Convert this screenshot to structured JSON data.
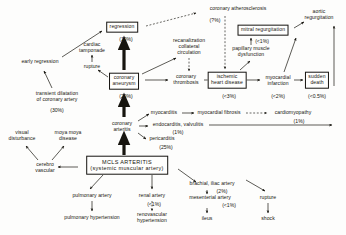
{
  "diagram": {
    "nodes": [
      {
        "id": "regression",
        "label": "regression",
        "pct": "(10%)",
        "boxed": true,
        "x": 122,
        "y": 27
      },
      {
        "id": "coronary-atherosclerosis",
        "label": "coronary atherosclerosis",
        "pct": "(?%)",
        "boxed": false,
        "x": 238,
        "y": 9
      },
      {
        "id": "cardiac-tamponade",
        "label": "cardiac\ntamponade",
        "pct": "",
        "boxed": false,
        "x": 92,
        "y": 48
      },
      {
        "id": "rupture-top",
        "label": "rupture",
        "pct": "",
        "boxed": false,
        "x": 92,
        "y": 67
      },
      {
        "id": "early-regression",
        "label": "early regression",
        "pct": "",
        "boxed": false,
        "x": 40,
        "y": 62
      },
      {
        "id": "transient-dilatation",
        "label": "transient dilatation\nof coronary artery",
        "pct": "(30%)",
        "boxed": false,
        "x": 57,
        "y": 97
      },
      {
        "id": "coronary-aneurysm",
        "label": "coronary\naneurysm",
        "pct": "(20%)",
        "boxed": true,
        "x": 124,
        "y": 81
      },
      {
        "id": "recanalization",
        "label": "recanalization\ncollateral\ncirculation",
        "pct": "",
        "boxed": false,
        "x": 189,
        "y": 47
      },
      {
        "id": "coronary-thrombosis",
        "label": "coronary\nthrombosis",
        "pct": "",
        "boxed": false,
        "x": 186,
        "y": 80
      },
      {
        "id": "mitral-regurgitation",
        "label": "mitral regurgitation",
        "pct": "(<1%)",
        "boxed": true,
        "x": 263,
        "y": 30
      },
      {
        "id": "papillary-muscle",
        "label": "papillary muscle\ndysfunction",
        "pct": "",
        "boxed": false,
        "x": 251,
        "y": 52
      },
      {
        "id": "aortic-regurgitation",
        "label": "aortic\nregurgitation",
        "pct": "",
        "boxed": false,
        "x": 319,
        "y": 15
      },
      {
        "id": "ischemic-heart-disease",
        "label": "ischemic\nheart disease",
        "pct": "(<3%)",
        "boxed": true,
        "x": 227,
        "y": 80
      },
      {
        "id": "myocardial-infarction",
        "label": "myocardial\ninfarction",
        "pct": "(<2%)",
        "boxed": false,
        "x": 278,
        "y": 81
      },
      {
        "id": "sudden-death",
        "label": "sudden\ndeath",
        "pct": "(<0.5%)",
        "boxed": true,
        "x": 317,
        "y": 80
      },
      {
        "id": "myocarditis",
        "label": "myocarditis",
        "pct": "",
        "boxed": false,
        "x": 164,
        "y": 113
      },
      {
        "id": "myocardial-fibrosis",
        "label": "myocardial fibrosis",
        "pct": "",
        "boxed": false,
        "x": 219,
        "y": 113
      },
      {
        "id": "cardiomyopathy",
        "label": "cardiomyopathy",
        "pct": "(1%)",
        "boxed": false,
        "x": 293,
        "y": 113
      },
      {
        "id": "endocarditis",
        "label": "endocarditis, valvulitis",
        "pct": "(1%)",
        "boxed": false,
        "x": 178,
        "y": 125
      },
      {
        "id": "pericarditis",
        "label": "pericarditis",
        "pct": "(25%)",
        "boxed": false,
        "x": 162,
        "y": 139
      },
      {
        "id": "coronary-arteritis",
        "label": "coronary\narteritis",
        "pct": "",
        "boxed": false,
        "x": 122,
        "y": 127
      },
      {
        "id": "visual-disturbance",
        "label": "visual\ndisturbance",
        "pct": "",
        "boxed": false,
        "x": 22,
        "y": 136
      },
      {
        "id": "moya-moya",
        "label": "moya moya\ndisease",
        "pct": "",
        "boxed": false,
        "x": 68,
        "y": 136
      },
      {
        "id": "cerebro-vascular",
        "label": "cerebro\nvascular",
        "pct": "",
        "boxed": false,
        "x": 45,
        "y": 168
      },
      {
        "id": "mcls-arteritis",
        "label": "MCLS ARTERITIS\n(systemic muscular artery)",
        "pct": "",
        "boxed": true,
        "x": 127,
        "y": 165,
        "big": true
      },
      {
        "id": "pulmonary-artery",
        "label": "pulmonary artery",
        "pct": "",
        "boxed": false,
        "x": 92,
        "y": 196
      },
      {
        "id": "pulmonary-hypertension",
        "label": "pulmonary hypertension",
        "pct": "",
        "boxed": false,
        "x": 92,
        "y": 218
      },
      {
        "id": "renal-artery",
        "label": "renal artery",
        "pct": "(<1%)",
        "boxed": false,
        "x": 152,
        "y": 196
      },
      {
        "id": "renovascular-hypertension",
        "label": "renovascular\nhypertension",
        "pct": "",
        "boxed": false,
        "x": 152,
        "y": 218
      },
      {
        "id": "brachial-iliac-artery",
        "label": "brachial, iliac artery",
        "pct": "(2%)",
        "boxed": false,
        "x": 212,
        "y": 184
      },
      {
        "id": "mesenterial-artery",
        "label": "mesenterial artery",
        "pct": "(<1%)",
        "boxed": false,
        "x": 210,
        "y": 198
      },
      {
        "id": "ileus",
        "label": "ileus",
        "pct": "",
        "boxed": false,
        "x": 207,
        "y": 219
      },
      {
        "id": "rupture-bottom",
        "label": "rupture",
        "pct": "",
        "boxed": false,
        "x": 268,
        "y": 198
      },
      {
        "id": "shock",
        "label": "shock",
        "pct": "",
        "boxed": false,
        "x": 268,
        "y": 219
      }
    ],
    "percent_labels": [
      {
        "id": "pct-regression",
        "text": "(10%)",
        "x": 126,
        "y": 39
      },
      {
        "id": "pct-atherosclerosis",
        "text": "(?%)",
        "x": 215,
        "y": 20
      },
      {
        "id": "pct-transient-dilatation",
        "text": "(30%)",
        "x": 57,
        "y": 110
      },
      {
        "id": "pct-coronary-aneurysm",
        "text": "(20%)",
        "x": 126,
        "y": 96
      },
      {
        "id": "pct-mitral-regurgitation",
        "text": "(<1%)",
        "x": 262,
        "y": 41
      },
      {
        "id": "pct-ischemic",
        "text": "(<3%)",
        "x": 229,
        "y": 96
      },
      {
        "id": "pct-myocardial-infarction",
        "text": "(<2%)",
        "x": 278,
        "y": 96
      },
      {
        "id": "pct-sudden-death",
        "text": "(<0.5%)",
        "x": 317,
        "y": 96
      },
      {
        "id": "pct-cardiomyopathy",
        "text": "(1%)",
        "x": 299,
        "y": 121
      },
      {
        "id": "pct-endocarditis",
        "text": "(1%)",
        "x": 178,
        "y": 132
      },
      {
        "id": "pct-pericarditis",
        "text": "(25%)",
        "x": 166,
        "y": 147
      },
      {
        "id": "pct-renal-artery",
        "text": "(<1%)",
        "x": 154,
        "y": 204
      },
      {
        "id": "pct-brachial",
        "text": "(2%)",
        "x": 222,
        "y": 191
      },
      {
        "id": "pct-mesenterial",
        "text": "(<1%)",
        "x": 229,
        "y": 205
      }
    ],
    "edges": [
      {
        "id": "mcls-to-coronary-arteritis",
        "style": "thick",
        "d": "M 124 155 L 124 137"
      },
      {
        "id": "coronary-arteritis-to-aneurysm",
        "style": "thick",
        "d": "M 124 117 L 124 99"
      },
      {
        "id": "aneurysm-to-regression",
        "style": "thick",
        "d": "M 124 70 L 124 42"
      },
      {
        "id": "early-regression-to-regression",
        "style": "thin",
        "d": "M 62 57 L 102 31"
      },
      {
        "id": "transient-to-early-regression",
        "style": "thin",
        "d": "M 52 88 L 44 71"
      },
      {
        "id": "aneurysm-to-rupture",
        "style": "thin",
        "d": "M 108 77 L 98 70"
      },
      {
        "id": "rupture-to-tamponade",
        "style": "thin",
        "d": "M 92 62 L 92 55"
      },
      {
        "id": "regression-to-atherosclerosis",
        "style": "dashed",
        "d": "M 146 26 L 196 13"
      },
      {
        "id": "aneurysm-to-recanalization",
        "style": "thin",
        "d": "M 142 74 L 176 58"
      },
      {
        "id": "recanalization-to-thrombosis",
        "style": "dashed",
        "d": "M 189 58 L 189 71"
      },
      {
        "id": "aneurysm-to-thrombosis",
        "style": "thin",
        "d": "M 145 80 L 168 80"
      },
      {
        "id": "thrombosis-to-ischemic",
        "style": "thin",
        "d": "M 204 80 L 211 80"
      },
      {
        "id": "atherosclerosis-to-ischemic",
        "style": "dashed",
        "d": "M 225 16 L 225 69"
      },
      {
        "id": "ischemic-to-papillary",
        "style": "thin",
        "d": "M 240 70 L 250 61"
      },
      {
        "id": "papillary-to-mitral",
        "style": "thin",
        "d": "M 251 45 L 251 38"
      },
      {
        "id": "mitral-to-aortic",
        "style": "thin",
        "d": "M 294 28 L 304 22"
      },
      {
        "id": "infarction-to-mitral",
        "style": "thin",
        "d": "M 284 72 L 296 38"
      },
      {
        "id": "ischemic-to-infarction",
        "style": "thin",
        "d": "M 244 80 L 260 80"
      },
      {
        "id": "infarction-to-sudden-death",
        "style": "thin",
        "d": "M 294 80 L 303 80"
      },
      {
        "id": "sudden-death-up-aortic",
        "style": "thin",
        "d": "M 334 86 L 334 26"
      },
      {
        "id": "arteritis-to-myocarditis",
        "style": "thin",
        "d": "M 138 121 L 149 114"
      },
      {
        "id": "arteritis-to-endocarditis",
        "style": "thin",
        "d": "M 139 126 L 148 126"
      },
      {
        "id": "arteritis-to-pericarditis",
        "style": "thin",
        "d": "M 138 133 L 146 139"
      },
      {
        "id": "myocarditis-to-fibrosis",
        "style": "thin",
        "d": "M 182 113 L 194 113"
      },
      {
        "id": "fibrosis-to-cardiomyopathy",
        "style": "dashed",
        "d": "M 246 113 L 267 113"
      },
      {
        "id": "endocarditis-to-aortic-line",
        "style": "thin",
        "d": "M 209 125 L 332 125"
      },
      {
        "id": "mcls-to-cerebro",
        "style": "thin",
        "d": "M 78 167 L 58 167"
      },
      {
        "id": "cerebro-to-visual",
        "style": "thin",
        "d": "M 38 160 L 26 146"
      },
      {
        "id": "cerebro-to-moya",
        "style": "thin",
        "d": "M 52 160 L 64 146"
      },
      {
        "id": "mcls-to-pulmonary",
        "style": "thin",
        "d": "M 103 175 L 90 189"
      },
      {
        "id": "pulmonary-to-hypertension",
        "style": "thin",
        "d": "M 92 201 L 92 211"
      },
      {
        "id": "mcls-to-renal",
        "style": "thin",
        "d": "M 152 175 L 152 189"
      },
      {
        "id": "renal-to-renovascular",
        "style": "dashed",
        "d": "M 152 201 L 152 211"
      },
      {
        "id": "mcls-to-brachial",
        "style": "thin",
        "d": "M 178 169 L 196 182"
      },
      {
        "id": "brachial-to-mesenterial",
        "style": "thin",
        "d": "M 207 190 L 207 194"
      },
      {
        "id": "mesenterial-to-ileus",
        "style": "thin",
        "d": "M 207 208 L 207 213"
      },
      {
        "id": "brachial-to-rupture",
        "style": "thin",
        "d": "M 246 180 L 265 191"
      },
      {
        "id": "rupture-to-shock",
        "style": "thin",
        "d": "M 268 203 L 268 213"
      }
    ]
  }
}
